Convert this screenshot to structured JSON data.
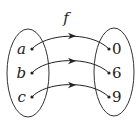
{
  "function_label": "f",
  "domain": {
    "elements": [
      "a",
      "b",
      "c"
    ]
  },
  "codomain": {
    "elements": [
      "0",
      "6",
      "9"
    ]
  },
  "mappings": [
    {
      "from": "a",
      "to": "0"
    },
    {
      "from": "b",
      "to": "6"
    },
    {
      "from": "c",
      "to": "9"
    }
  ]
}
